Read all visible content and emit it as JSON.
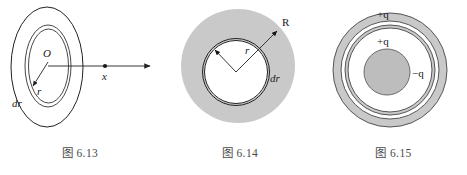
{
  "page": {
    "background": "#ffffff",
    "fill_gray": "#c9c9c9",
    "stroke_color": "#222222",
    "text_color": "#1a1a1a",
    "caption_color": "#4a4a4a"
  },
  "figures": [
    {
      "id": "fig-613",
      "caption": "图 6.13",
      "type": "nested-ellipses-with-axis",
      "labels": {
        "center": "O",
        "radius": "r",
        "thickness": "dr",
        "axis_point": "x"
      },
      "description": "Charged disc drawn in perspective as nested ellipses with a ring element dr at radius r, and an axis through centre O to field point x"
    },
    {
      "id": "fig-614",
      "caption": "图 6.14",
      "type": "filled-disk-with-ring",
      "labels": {
        "outer_radius": "R",
        "ring_radius": "r",
        "thickness": "dr"
      },
      "description": "Uniformly charged disc of radius R with a thin concentric ring of radius r and width dr"
    },
    {
      "id": "fig-615",
      "caption": "图 6.15",
      "type": "concentric-shells",
      "labels": {
        "outer_shell_charge": "+q",
        "inner_shell_charge": "+q",
        "core_charge": "−q"
      },
      "description": "Concentric spherical conductors: outer shell carrying +q, middle shell carrying +q, inner core carrying −q"
    }
  ]
}
